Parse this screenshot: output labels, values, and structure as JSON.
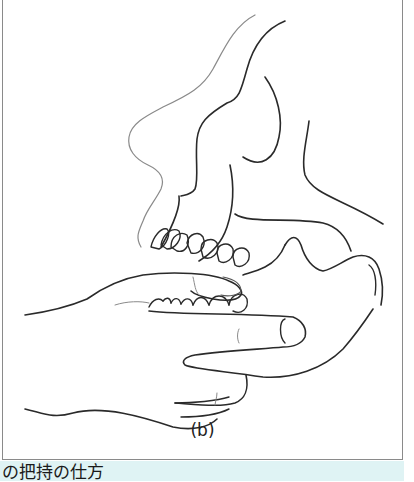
{
  "figure": {
    "sublabel": "(b)",
    "caption": "の把持の仕方",
    "colors": {
      "line": "#2a2a2a",
      "soft_tissue_line": "#8a8a8a",
      "frame_border": "#8a8a8a",
      "caption_bg": "#dff3f4"
    }
  }
}
